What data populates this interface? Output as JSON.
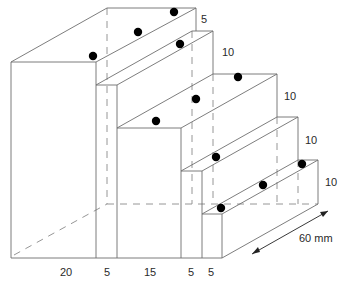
{
  "diagram": {
    "type": "stepped-block-isometric",
    "width_labels": [
      "20",
      "5",
      "15",
      "5",
      "5"
    ],
    "height_labels": [
      "5",
      "10",
      "10",
      "10",
      "10"
    ],
    "depth_label": "60 mm",
    "colors": {
      "line": "#6e6e6e",
      "dot": "#000000",
      "text": "#2a2a2a"
    }
  }
}
